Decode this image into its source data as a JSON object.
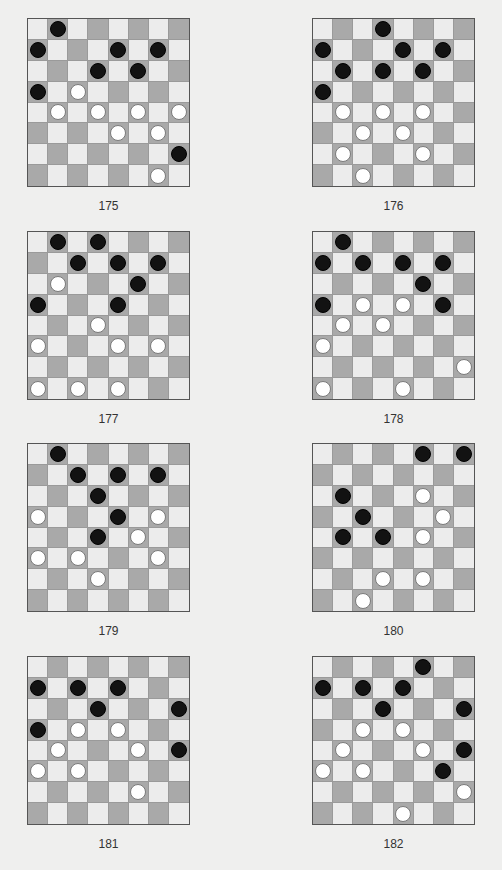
{
  "page": {
    "colors": {
      "light_square": "#ececec",
      "dark_square": "#a9a9a9",
      "black_piece": "#121212",
      "white_piece": "#ffffff",
      "background": "#efefee"
    }
  },
  "puzzles": [
    {
      "number": "175",
      "black": [
        [
          0,
          1
        ],
        [
          1,
          0
        ],
        [
          1,
          4
        ],
        [
          1,
          6
        ],
        [
          2,
          3
        ],
        [
          2,
          5
        ],
        [
          3,
          0
        ],
        [
          6,
          7
        ]
      ],
      "white": [
        [
          3,
          2
        ],
        [
          4,
          1
        ],
        [
          4,
          3
        ],
        [
          4,
          5
        ],
        [
          4,
          7
        ],
        [
          5,
          4
        ],
        [
          5,
          6
        ],
        [
          7,
          6
        ]
      ]
    },
    {
      "number": "176",
      "black": [
        [
          0,
          3
        ],
        [
          1,
          0
        ],
        [
          1,
          4
        ],
        [
          1,
          6
        ],
        [
          2,
          1
        ],
        [
          2,
          3
        ],
        [
          2,
          5
        ],
        [
          3,
          0
        ]
      ],
      "white": [
        [
          4,
          1
        ],
        [
          4,
          3
        ],
        [
          4,
          5
        ],
        [
          5,
          2
        ],
        [
          5,
          4
        ],
        [
          6,
          1
        ],
        [
          6,
          5
        ],
        [
          7,
          2
        ]
      ]
    },
    {
      "number": "177",
      "black": [
        [
          0,
          1
        ],
        [
          0,
          3
        ],
        [
          1,
          2
        ],
        [
          1,
          4
        ],
        [
          1,
          6
        ],
        [
          2,
          5
        ],
        [
          3,
          0
        ],
        [
          3,
          4
        ]
      ],
      "white": [
        [
          2,
          1
        ],
        [
          4,
          3
        ],
        [
          5,
          0
        ],
        [
          5,
          4
        ],
        [
          5,
          6
        ],
        [
          7,
          0
        ],
        [
          7,
          2
        ],
        [
          7,
          4
        ]
      ]
    },
    {
      "number": "178",
      "black": [
        [
          0,
          1
        ],
        [
          1,
          0
        ],
        [
          1,
          2
        ],
        [
          1,
          4
        ],
        [
          1,
          6
        ],
        [
          2,
          5
        ],
        [
          3,
          0
        ],
        [
          3,
          6
        ]
      ],
      "white": [
        [
          3,
          2
        ],
        [
          3,
          4
        ],
        [
          4,
          1
        ],
        [
          4,
          3
        ],
        [
          5,
          0
        ],
        [
          6,
          7
        ],
        [
          7,
          0
        ],
        [
          7,
          4
        ]
      ]
    },
    {
      "number": "179",
      "black": [
        [
          0,
          1
        ],
        [
          1,
          2
        ],
        [
          1,
          4
        ],
        [
          1,
          6
        ],
        [
          2,
          3
        ],
        [
          3,
          4
        ],
        [
          4,
          3
        ]
      ],
      "white": [
        [
          3,
          0
        ],
        [
          3,
          6
        ],
        [
          4,
          5
        ],
        [
          5,
          0
        ],
        [
          5,
          2
        ],
        [
          5,
          6
        ],
        [
          6,
          3
        ]
      ]
    },
    {
      "number": "180",
      "black": [
        [
          0,
          5
        ],
        [
          0,
          7
        ],
        [
          2,
          1
        ],
        [
          3,
          2
        ],
        [
          4,
          1
        ],
        [
          4,
          3
        ]
      ],
      "white": [
        [
          2,
          5
        ],
        [
          3,
          6
        ],
        [
          4,
          5
        ],
        [
          6,
          3
        ],
        [
          6,
          5
        ],
        [
          7,
          2
        ]
      ]
    },
    {
      "number": "181",
      "black": [
        [
          1,
          0
        ],
        [
          1,
          2
        ],
        [
          1,
          4
        ],
        [
          2,
          3
        ],
        [
          2,
          7
        ],
        [
          3,
          0
        ],
        [
          4,
          7
        ]
      ],
      "white": [
        [
          3,
          2
        ],
        [
          3,
          4
        ],
        [
          4,
          1
        ],
        [
          4,
          5
        ],
        [
          5,
          0
        ],
        [
          5,
          2
        ],
        [
          6,
          5
        ]
      ]
    },
    {
      "number": "182",
      "black": [
        [
          0,
          5
        ],
        [
          1,
          0
        ],
        [
          1,
          2
        ],
        [
          1,
          4
        ],
        [
          2,
          3
        ],
        [
          2,
          7
        ],
        [
          4,
          7
        ],
        [
          5,
          6
        ]
      ],
      "white": [
        [
          3,
          2
        ],
        [
          3,
          4
        ],
        [
          4,
          1
        ],
        [
          4,
          5
        ],
        [
          5,
          0
        ],
        [
          5,
          2
        ],
        [
          6,
          7
        ],
        [
          7,
          4
        ]
      ]
    }
  ]
}
